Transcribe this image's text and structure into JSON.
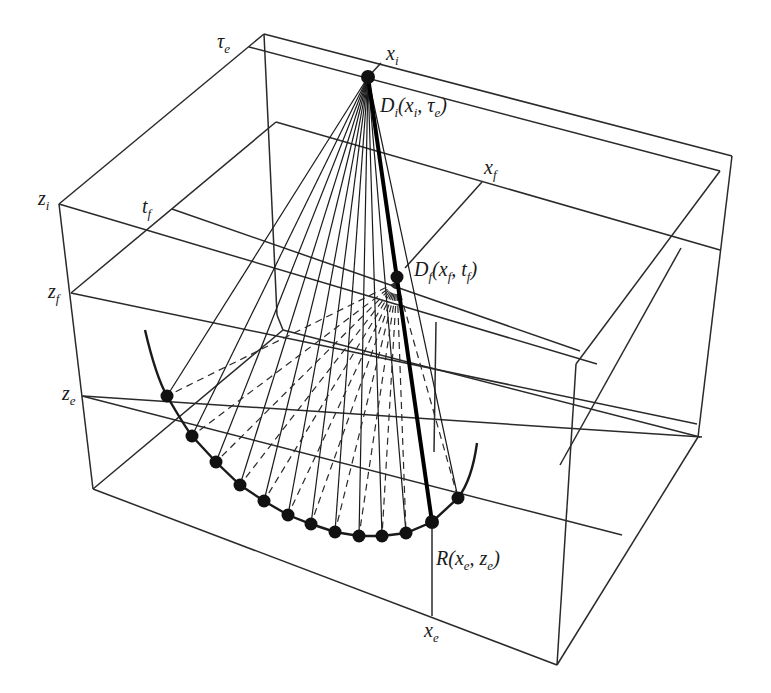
{
  "figure": {
    "type": "3D ray-path wireframe diagram (downward continuation / focusing)",
    "labels": {
      "tau_e": {
        "main": "τ",
        "sub": "e"
      },
      "x_i": {
        "main": "x",
        "sub": "i"
      },
      "D_i": {
        "main": "D",
        "sub": "i",
        "args": "(x",
        "args_sub1": "i",
        "args_mid": ", τ",
        "args_sub2": "e",
        "args_end": ")"
      },
      "z_i": {
        "main": "z",
        "sub": "i"
      },
      "t_f": {
        "main": "t",
        "sub": "f"
      },
      "x_f": {
        "main": "x",
        "sub": "f"
      },
      "D_f": {
        "main": "D",
        "sub": "f",
        "args": "(x",
        "args_sub1": "f",
        "args_mid": ", t",
        "args_sub2": "f",
        "args_end": ")"
      },
      "z_f": {
        "main": "z",
        "sub": "f"
      },
      "z_e": {
        "main": "z",
        "sub": "e"
      },
      "R": {
        "main": "R",
        "args": "(x",
        "args_sub1": "e",
        "args_mid": ", z",
        "args_sub2": "e",
        "args_end": ")"
      },
      "x_e": {
        "main": "x",
        "sub": "e"
      }
    },
    "points": {
      "D_i": [
        368,
        77
      ],
      "D_f": [
        397,
        277
      ],
      "R": [
        432,
        522
      ]
    },
    "reflector_dots": [
      [
        167,
        396
      ],
      [
        192,
        436
      ],
      [
        216,
        462
      ],
      [
        240,
        485
      ],
      [
        264,
        501
      ],
      [
        288,
        515
      ],
      [
        311,
        524
      ],
      [
        335,
        532
      ],
      [
        359,
        536
      ],
      [
        382,
        536
      ],
      [
        406,
        533
      ],
      [
        432,
        522
      ],
      [
        458,
        498
      ]
    ],
    "colors": {
      "line": "#2a2a2a",
      "dot": "#111111",
      "background": "#ffffff"
    }
  }
}
